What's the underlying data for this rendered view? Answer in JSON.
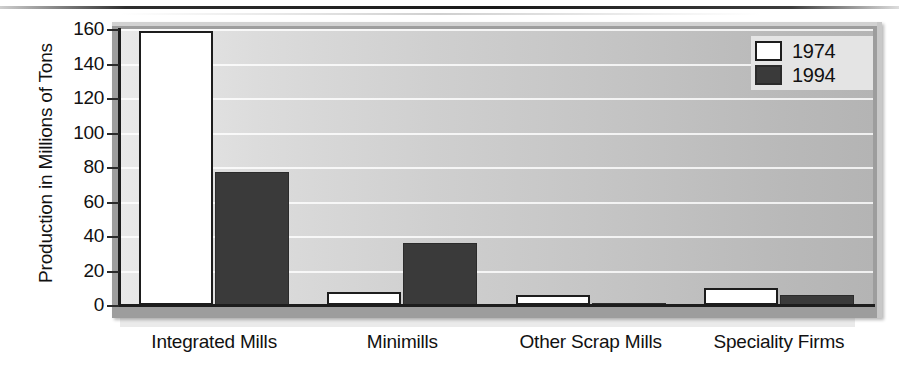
{
  "chart_data": {
    "type": "bar",
    "title": "",
    "subtitle": "",
    "xlabel": "",
    "ylabel": "Production in Millions of Tons",
    "categories": [
      "Integrated Mills",
      "Minimills",
      "Other Scrap Mills",
      "Speciality Firms"
    ],
    "series": [
      {
        "name": "1974",
        "color": "#ffffff",
        "values": [
          159,
          7.5,
          6,
          10
        ]
      },
      {
        "name": "1994",
        "color": "#3a3a3a",
        "values": [
          77,
          36,
          1,
          6
        ]
      }
    ],
    "ylim": [
      0,
      160
    ],
    "yticks": [
      0,
      20,
      40,
      60,
      80,
      100,
      120,
      140,
      160
    ],
    "ytick_labels": [
      "0",
      "20",
      "40",
      "60",
      "80",
      "100",
      "120",
      "140",
      "160"
    ],
    "grid": true,
    "grid_axis": "y",
    "legend": {
      "position": "top-right",
      "entries": [
        "1974",
        "1994"
      ]
    },
    "plot_background": "#cfcfcf",
    "frame_color": "#9d9d9d",
    "axis_color": "#1d1d1d"
  }
}
